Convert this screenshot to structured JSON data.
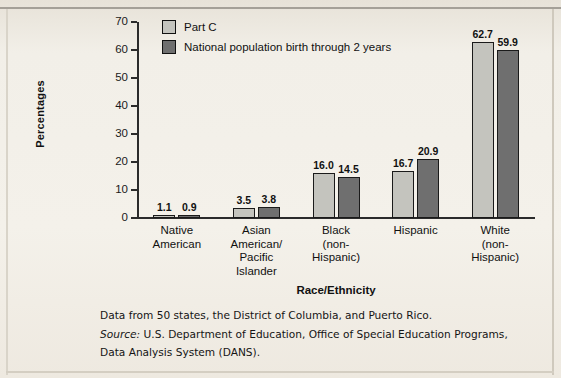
{
  "chart_data": {
    "type": "bar",
    "title": "",
    "xlabel": "Race/Ethnicity",
    "ylabel": "Percentages",
    "ylim": [
      0,
      70
    ],
    "yticks": [
      0,
      10,
      20,
      30,
      40,
      50,
      60,
      70
    ],
    "grid": false,
    "legend_position": "top-left",
    "categories": [
      "Native\nAmerican",
      "Asian\nAmerican/\nPacific\nIslander",
      "Black\n(non-\nHispanic)",
      "Hispanic",
      "White\n(non-\nHispanic)"
    ],
    "category_lines": [
      [
        "Native",
        "American"
      ],
      [
        "Asian",
        "American/",
        "Pacific",
        "Islander"
      ],
      [
        "Black",
        "(non-",
        "Hispanic)"
      ],
      [
        "Hispanic"
      ],
      [
        "White",
        "(non-",
        "Hispanic)"
      ]
    ],
    "series": [
      {
        "name": "Part C",
        "color": "#c4c4be",
        "values": [
          1.1,
          3.5,
          16.0,
          16.7,
          62.7
        ],
        "labels": [
          "1.1",
          "3.5",
          "16.0",
          "16.7",
          "62.7"
        ]
      },
      {
        "name": "National population birth through 2 years",
        "color": "#6f6f6f",
        "values": [
          0.9,
          3.8,
          14.5,
          20.9,
          59.9
        ],
        "labels": [
          "0.9",
          "3.8",
          "14.5",
          "20.9",
          "59.9"
        ]
      }
    ]
  },
  "notes": {
    "data_note": "Data from 50 states, the District of Columbia, and Puerto Rico.",
    "source_label": "Source:",
    "source_line1": " U.S. Department of Education, Office of Special Education Programs,",
    "source_line2": "Data Analysis System (DANS)."
  }
}
